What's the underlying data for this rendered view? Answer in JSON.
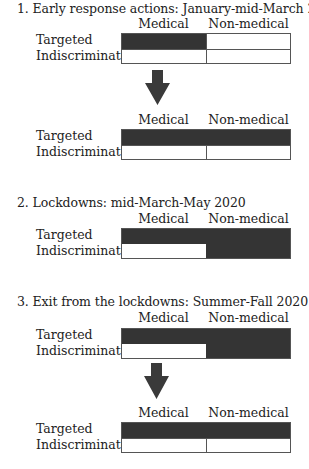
{
  "columns": [
    "Medical",
    "Non-medical"
  ],
  "rows": [
    "Targeted",
    "Indiscriminate"
  ],
  "fill_color": "#343434",
  "phases": [
    {
      "title": "1. Early response actions: January-mid-March 2020",
      "grids": [
        {
          "targeted_medical": true,
          "targeted_nonmedical": false,
          "indiscriminate_medical": false,
          "indiscriminate_nonmedical": false
        },
        {
          "targeted_medical": true,
          "targeted_nonmedical": true,
          "indiscriminate_medical": false,
          "indiscriminate_nonmedical": false
        }
      ]
    },
    {
      "title": "2. Lockdowns: mid-March-May 2020",
      "grids": [
        {
          "targeted_medical": true,
          "targeted_nonmedical": true,
          "indiscriminate_medical": false,
          "indiscriminate_nonmedical": true
        }
      ]
    },
    {
      "title": "3. Exit from the lockdowns: Summer-Fall 2020",
      "grids": [
        {
          "targeted_medical": true,
          "targeted_nonmedical": true,
          "indiscriminate_medical": false,
          "indiscriminate_nonmedical": true
        },
        {
          "targeted_medical": true,
          "targeted_nonmedical": true,
          "indiscriminate_medical": false,
          "indiscriminate_nonmedical": false
        }
      ]
    }
  ]
}
